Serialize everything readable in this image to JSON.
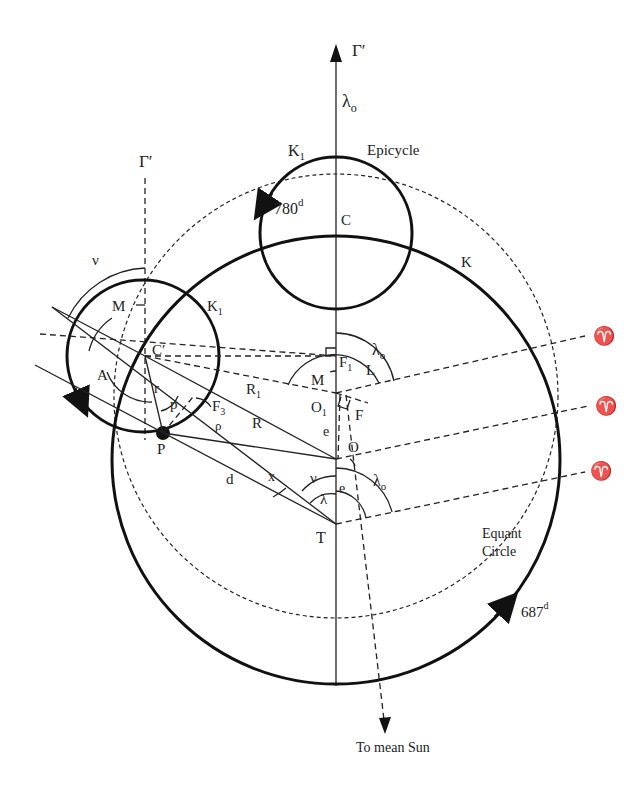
{
  "diagram": {
    "labels": {
      "gamma_top": "Γ′",
      "gamma_left": "Γ′",
      "lambda0_top": "λ",
      "lambda0_top_sub": "o",
      "k1_top": "K",
      "k1_top_sub": "1",
      "epicycle": "Epicycle",
      "period_epicycle": "780",
      "period_epicycle_sup": "d",
      "c": "C",
      "k": "K",
      "nu_left": "ν",
      "m_left": "M",
      "k1_left": "K",
      "k1_left_sub": "1",
      "c_prime": "C′",
      "a": "A",
      "r": "r",
      "p": "p",
      "f3": "F",
      "f3_sub": "3",
      "rho": "ρ",
      "planet": "P",
      "r1": "R",
      "r1_sub": "1",
      "big_r": "R",
      "d": "d",
      "x": "x",
      "lambda0_mid": "λ",
      "lambda0_mid_sub": "o",
      "f1": "F",
      "f1_sub": "1",
      "l": "L",
      "m_mid": "M",
      "o1": "O",
      "o1_sub": "1",
      "f": "F",
      "e_upper": "e",
      "o": "O",
      "nu_lower": "ν",
      "e_lower": "e",
      "lambda_lower": "λ",
      "lambda0_lower": "λ",
      "lambda0_lower_sub": "o",
      "t": "T",
      "aries_1": "♈",
      "aries_2": "♈",
      "aries_3": "♈",
      "equant_1": "Equant",
      "equant_2": "Circle",
      "period_orbit": "687",
      "period_orbit_sup": "d",
      "to_sun": "To mean Sun"
    },
    "colors": {
      "ink": "#111111",
      "background": "#ffffff"
    }
  }
}
